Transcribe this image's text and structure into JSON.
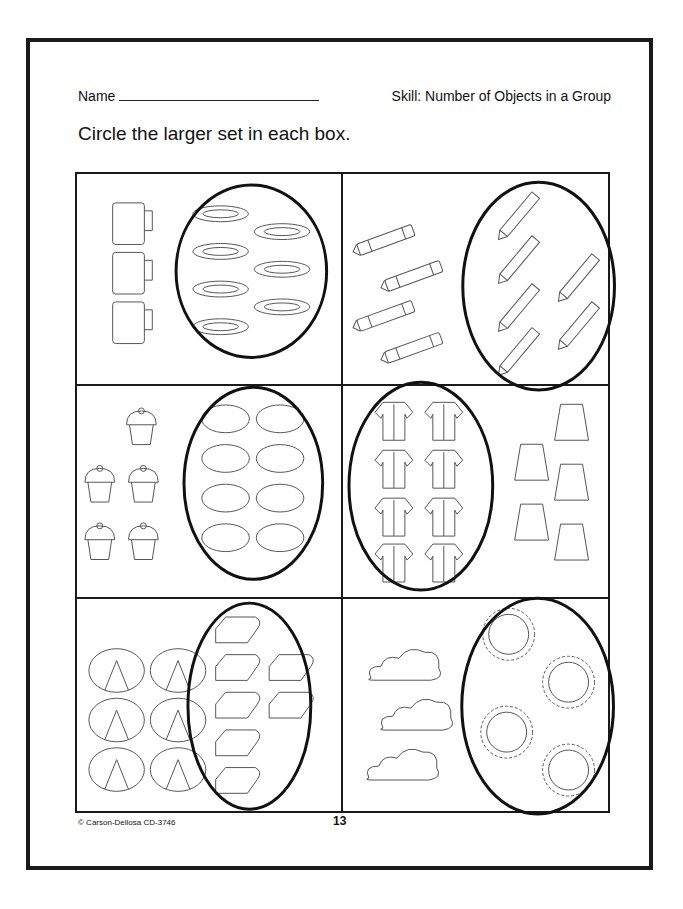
{
  "header": {
    "name_label": "Name",
    "skill": "Skill: Number of Objects in a Group"
  },
  "instructions": "Circle the larger set in each box.",
  "boxes": [
    {
      "left_set": {
        "object": "mug",
        "count": 3
      },
      "right_set": {
        "object": "plate",
        "count": 7
      },
      "circled": "right"
    },
    {
      "left_set": {
        "object": "crayon",
        "count": 4
      },
      "right_set": {
        "object": "pencil",
        "count": 6
      },
      "circled": "right"
    },
    {
      "left_set": {
        "object": "cupcake",
        "count": 5
      },
      "right_set": {
        "object": "pie",
        "count": 8
      },
      "circled": "right"
    },
    {
      "left_set": {
        "object": "shirt",
        "count": 8
      },
      "right_set": {
        "object": "skirt",
        "count": 5
      },
      "circled": "left"
    },
    {
      "left_set": {
        "object": "pretzel",
        "count": 6
      },
      "right_set": {
        "object": "bread-slice",
        "count": 7
      },
      "circled": "right"
    },
    {
      "left_set": {
        "object": "cloud",
        "count": 3
      },
      "right_set": {
        "object": "sun",
        "count": 4
      },
      "circled": "right"
    }
  ],
  "footer": {
    "copyright": "© Carson-Dellosa CD-3746",
    "page_number": "13"
  }
}
